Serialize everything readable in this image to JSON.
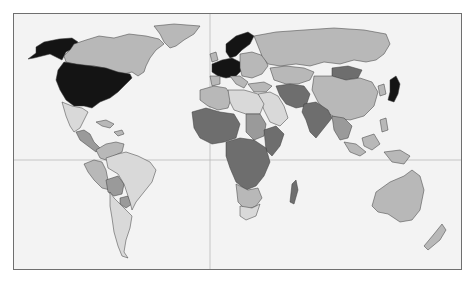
{
  "map": {
    "type": "choropleth-world",
    "projection": "equirectangular-like, Pacific-left cropped",
    "background_color": "#f3f3f3",
    "frame_color": "#6f6f6f",
    "gridline_color": "#b9b9b9",
    "gridlines": {
      "equator_y": 146,
      "meridian_x": 196
    },
    "shade_levels": {
      "level_5_black": "#141414",
      "level_4_dark": "#6e6e6e",
      "level_3_medium": "#9a9a9a",
      "level_2_light": "#b8b8b8",
      "level_1_lightest": "#d9d9d9"
    },
    "regions": [
      {
        "name": "alaska",
        "level": "level_5_black"
      },
      {
        "name": "canada",
        "level": "level_2_light"
      },
      {
        "name": "greenland",
        "level": "level_2_light"
      },
      {
        "name": "usa",
        "level": "level_5_black"
      },
      {
        "name": "mexico",
        "level": "level_1_lightest"
      },
      {
        "name": "central-america",
        "level": "level_3_medium"
      },
      {
        "name": "caribbean",
        "level": "level_2_light"
      },
      {
        "name": "colombia-venezuela",
        "level": "level_2_light"
      },
      {
        "name": "peru-ecuador",
        "level": "level_2_light"
      },
      {
        "name": "bolivia",
        "level": "level_3_medium"
      },
      {
        "name": "brazil",
        "level": "level_1_lightest"
      },
      {
        "name": "argentina-chile",
        "level": "level_1_lightest"
      },
      {
        "name": "paraguay",
        "level": "level_3_medium"
      },
      {
        "name": "western-europe",
        "level": "level_5_black"
      },
      {
        "name": "scandinavia",
        "level": "level_5_black"
      },
      {
        "name": "eastern-europe",
        "level": "level_2_light"
      },
      {
        "name": "russia",
        "level": "level_2_light"
      },
      {
        "name": "north-africa",
        "level": "level_1_lightest"
      },
      {
        "name": "morocco-algeria",
        "level": "level_2_light"
      },
      {
        "name": "west-africa",
        "level": "level_4_dark"
      },
      {
        "name": "central-africa",
        "level": "level_4_dark"
      },
      {
        "name": "east-africa",
        "level": "level_4_dark"
      },
      {
        "name": "sudan",
        "level": "level_3_medium"
      },
      {
        "name": "southern-africa",
        "level": "level_2_light"
      },
      {
        "name": "south-africa",
        "level": "level_1_lightest"
      },
      {
        "name": "madagascar",
        "level": "level_4_dark"
      },
      {
        "name": "middle-east",
        "level": "level_1_lightest"
      },
      {
        "name": "iran-afghanistan-pakistan",
        "level": "level_4_dark"
      },
      {
        "name": "central-asia",
        "level": "level_2_light"
      },
      {
        "name": "mongolia",
        "level": "level_4_dark"
      },
      {
        "name": "china",
        "level": "level_2_light"
      },
      {
        "name": "india",
        "level": "level_4_dark"
      },
      {
        "name": "southeast-asia",
        "level": "level_3_medium"
      },
      {
        "name": "japan",
        "level": "level_5_black"
      },
      {
        "name": "indonesia",
        "level": "level_2_light"
      },
      {
        "name": "australia",
        "level": "level_2_light"
      },
      {
        "name": "new-zealand",
        "level": "level_2_light"
      }
    ]
  }
}
